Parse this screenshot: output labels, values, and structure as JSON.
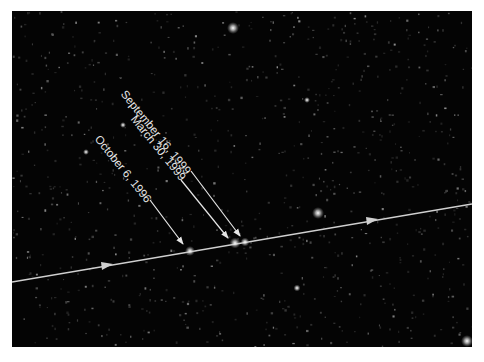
{
  "figure": {
    "background_color": "#040404",
    "line_color": "#d8d8d8",
    "annotations": [
      {
        "label": "September 16, 1999",
        "text_start": [
          128,
          91
        ],
        "arrow_from": [
          191,
          171
        ],
        "arrow_to": [
          240,
          236
        ]
      },
      {
        "label": "March 30, 1999",
        "text_start": [
          137,
          116
        ],
        "arrow_from": [
          181,
          180
        ],
        "arrow_to": [
          228,
          238
        ]
      },
      {
        "label": "October 6, 1996",
        "text_start": [
          100,
          137
        ],
        "arrow_from": [
          150,
          200
        ],
        "arrow_to": [
          183,
          244
        ]
      }
    ],
    "trajectory": {
      "start": [
        12,
        282
      ],
      "end": [
        472,
        204
      ],
      "direction_arrows": [
        [
          108,
          265
        ],
        [
          373,
          220
        ]
      ]
    },
    "marked_positions": [
      [
        190,
        251
      ],
      [
        235,
        243
      ],
      [
        245,
        242
      ]
    ],
    "bright_stars": [
      [
        233,
        28
      ],
      [
        318,
        213
      ],
      [
        297,
        288
      ],
      [
        466,
        341
      ],
      [
        86,
        152
      ],
      [
        307,
        100
      ],
      [
        123,
        125
      ]
    ]
  }
}
